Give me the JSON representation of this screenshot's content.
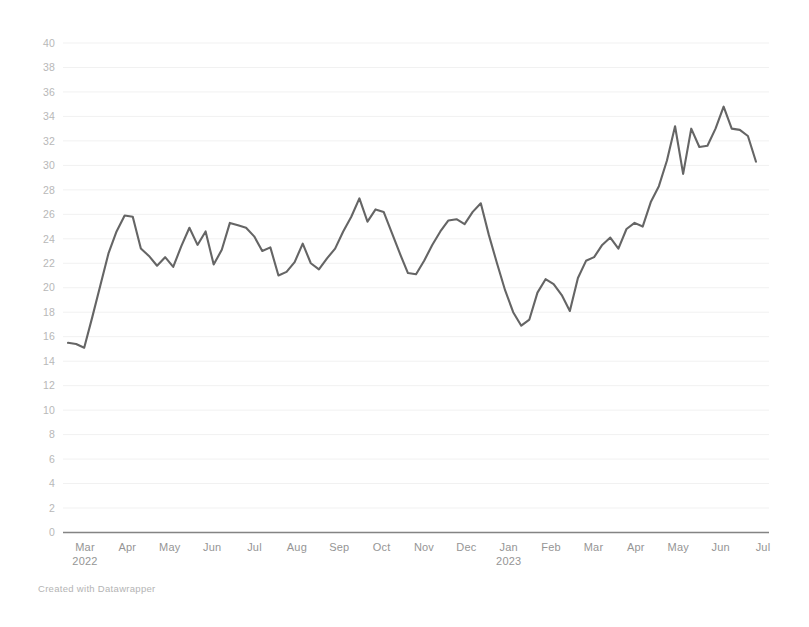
{
  "credit": {
    "text": "Created with Datawrapper"
  },
  "colors": {
    "line": "#5c5c5c",
    "axis": "#7d7d7d",
    "grid": "#f1f1f1",
    "tick_text": "#8f8f8f",
    "ytick_text": "#b4b4b4",
    "background": "#ffffff"
  },
  "chart_data": {
    "type": "line",
    "title": "",
    "subtitle": "",
    "xlabel": "",
    "ylabel": "",
    "ylim": [
      0,
      40
    ],
    "ytick_step": 2,
    "yticks": [
      0,
      2,
      4,
      6,
      8,
      10,
      12,
      14,
      16,
      18,
      20,
      22,
      24,
      26,
      28,
      30,
      32,
      34,
      36,
      38,
      40
    ],
    "grid": true,
    "legend": "none",
    "xticks": [
      {
        "label": "Mar",
        "year": "2022"
      },
      {
        "label": "Apr",
        "year": ""
      },
      {
        "label": "May",
        "year": ""
      },
      {
        "label": "Jun",
        "year": ""
      },
      {
        "label": "Jul",
        "year": ""
      },
      {
        "label": "Aug",
        "year": ""
      },
      {
        "label": "Sep",
        "year": ""
      },
      {
        "label": "Oct",
        "year": ""
      },
      {
        "label": "Nov",
        "year": ""
      },
      {
        "label": "Dec",
        "year": ""
      },
      {
        "label": "Jan",
        "year": "2023"
      },
      {
        "label": "Feb",
        "year": ""
      },
      {
        "label": "Mar",
        "year": ""
      },
      {
        "label": "Apr",
        "year": ""
      },
      {
        "label": "May",
        "year": ""
      },
      {
        "label": "Jun",
        "year": ""
      },
      {
        "label": "Jul",
        "year": ""
      }
    ],
    "x_range_label": "Mar 2022 – Jul 2023",
    "series": [
      {
        "name": "value",
        "values": [
          15.5,
          15.4,
          15.1,
          17.6,
          20.2,
          22.8,
          24.6,
          25.9,
          25.8,
          23.2,
          22.6,
          21.8,
          22.5,
          21.7,
          23.4,
          24.9,
          23.5,
          24.6,
          21.9,
          23.1,
          25.3,
          25.1,
          24.9,
          24.2,
          23.0,
          23.3,
          21.0,
          21.3,
          22.1,
          23.6,
          22.0,
          21.5,
          22.4,
          23.2,
          24.6,
          25.8,
          27.3,
          25.4,
          26.4,
          26.2,
          24.5,
          22.8,
          21.2,
          21.1,
          22.2,
          23.5,
          24.6,
          25.5,
          25.6,
          25.2,
          26.2,
          26.9,
          24.3,
          22.0,
          19.8,
          18.0,
          16.9,
          17.4,
          19.6,
          20.7,
          20.3,
          19.4,
          18.1,
          20.8,
          22.2,
          22.5,
          23.5,
          24.1,
          23.2,
          24.8,
          25.3,
          25.0,
          27.0,
          28.3,
          30.4,
          33.2,
          29.3,
          33.0,
          31.5,
          31.6,
          33.0,
          34.8,
          33.0,
          32.9,
          32.4,
          30.3
        ]
      }
    ]
  }
}
